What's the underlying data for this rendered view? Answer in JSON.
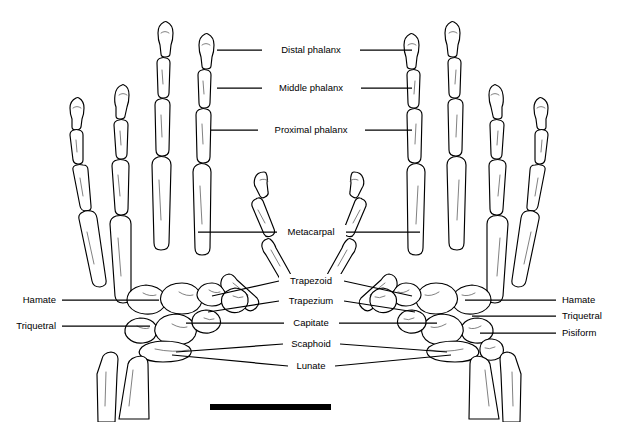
{
  "figure": {
    "title": "Skeletal anatomy of the human hands (dorsal view, bilateral pair)",
    "background_color": "#ffffff",
    "line_color": "#000000",
    "bone_fill": "#ffffff",
    "width": 618,
    "height": 422
  },
  "labels": {
    "center": [
      {
        "id": "distal-phalanx",
        "text": "Distal phalanx",
        "x": 311,
        "y": 50,
        "left_line": [
          217,
          50,
          262,
          50
        ],
        "right_line": [
          360,
          50,
          412,
          50
        ]
      },
      {
        "id": "middle-phalanx",
        "text": "Middle phalanx",
        "x": 311,
        "y": 88,
        "left_line": [
          217,
          88,
          262,
          88
        ],
        "right_line": [
          361,
          88,
          412,
          88
        ]
      },
      {
        "id": "proximal-phalanx",
        "text": "Proximal phalanx",
        "x": 311,
        "y": 130,
        "left_line": [
          211,
          130,
          258,
          130
        ],
        "right_line": [
          365,
          130,
          412,
          130
        ]
      },
      {
        "id": "metacarpal",
        "text": "Metacarpal",
        "x": 311,
        "y": 232,
        "left_line": [
          198,
          232,
          277,
          232
        ],
        "right_line": [
          346,
          232,
          420,
          232
        ]
      },
      {
        "id": "trapezoid",
        "text": "Trapezoid",
        "x": 311,
        "y": 281,
        "left_line": [
          212,
          296,
          279,
          281
        ],
        "right_line": [
          344,
          281,
          412,
          296
        ]
      },
      {
        "id": "trapezium",
        "text": "Trapezium",
        "x": 311,
        "y": 301,
        "left_line": [
          208,
          312,
          279,
          301
        ],
        "right_line": [
          344,
          301,
          415,
          312
        ]
      },
      {
        "id": "capitate",
        "text": "Capitate",
        "x": 311,
        "y": 323,
        "left_line": [
          186,
          323,
          284,
          323
        ],
        "right_line": [
          339,
          323,
          437,
          323
        ]
      },
      {
        "id": "scaphoid",
        "text": "Scaphoid",
        "x": 311,
        "y": 344,
        "left_line": [
          176,
          352,
          283,
          344
        ],
        "right_line": [
          340,
          344,
          447,
          352
        ]
      },
      {
        "id": "lunate",
        "text": "Lunate",
        "x": 311,
        "y": 366,
        "left_line": [
          172,
          355,
          288,
          366
        ],
        "right_line": [
          335,
          366,
          451,
          355
        ]
      }
    ],
    "left_side": [
      {
        "id": "hamate-left",
        "text": "Hamate",
        "x": 54,
        "y": 300,
        "line": [
          62,
          300,
          159,
          300
        ]
      },
      {
        "id": "triquetral-left",
        "text": "Triquetral",
        "x": 54,
        "y": 326,
        "line": [
          62,
          326,
          150,
          326
        ]
      }
    ],
    "right_side": [
      {
        "id": "hamate-right",
        "text": "Hamate",
        "x": 564,
        "y": 300,
        "line": [
          465,
          300,
          556,
          300
        ]
      },
      {
        "id": "triquetral-right",
        "text": "Triquetral",
        "x": 564,
        "y": 316,
        "line": [
          472,
          316,
          556,
          316
        ]
      },
      {
        "id": "pisiform-right",
        "text": "Pisiform",
        "x": 564,
        "y": 333,
        "line": [
          480,
          333,
          556,
          333
        ]
      }
    ]
  },
  "scale_bar": {
    "id": "scale-bar",
    "x": 210,
    "y": 404,
    "width": 121,
    "height": 6,
    "label": ""
  }
}
